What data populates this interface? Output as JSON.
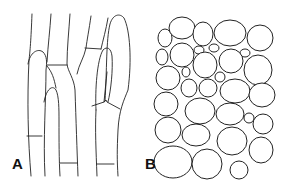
{
  "figure": {
    "panels": [
      {
        "id": "A",
        "label": "A",
        "description": "elongated tubular cells / hyphae with cross walls"
      },
      {
        "id": "B",
        "label": "B",
        "description": "rounded polygonal parenchyma-like cells"
      }
    ],
    "colors": {
      "line": "#222222",
      "background": "#ffffff",
      "label": "#111111"
    }
  }
}
